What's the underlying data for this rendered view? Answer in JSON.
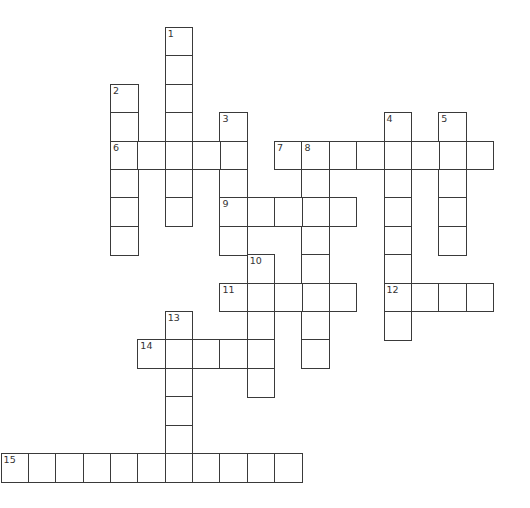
{
  "puzzle": {
    "grid": {
      "origin_x": 1.3,
      "origin_y": 27.7,
      "cell_w": 27.35,
      "cell_h": 28.4,
      "line_color": "#3a3a3a",
      "background": "#ffffff"
    },
    "entries": [
      {
        "number": "1",
        "direction": "down",
        "row": 0,
        "col": 6,
        "length": 7
      },
      {
        "number": "2",
        "direction": "down",
        "row": 2,
        "col": 4,
        "length": 6
      },
      {
        "number": "3",
        "direction": "down",
        "row": 3,
        "col": 8,
        "length": 5
      },
      {
        "number": "4",
        "direction": "down",
        "row": 3,
        "col": 14,
        "length": 8
      },
      {
        "number": "5",
        "direction": "down",
        "row": 3,
        "col": 16,
        "length": 5
      },
      {
        "number": "6",
        "direction": "across",
        "row": 4,
        "col": 4,
        "length": 5
      },
      {
        "number": "7",
        "direction": "across",
        "row": 4,
        "col": 10,
        "length": 8
      },
      {
        "number": "8",
        "direction": "down",
        "row": 4,
        "col": 11,
        "length": 8
      },
      {
        "number": "9",
        "direction": "across",
        "row": 6,
        "col": 8,
        "length": 5
      },
      {
        "number": "10",
        "direction": "down",
        "row": 8,
        "col": 9,
        "length": 5
      },
      {
        "number": "11",
        "direction": "across",
        "row": 9,
        "col": 8,
        "length": 5
      },
      {
        "number": "12",
        "direction": "across",
        "row": 9,
        "col": 14,
        "length": 4
      },
      {
        "number": "13",
        "direction": "down",
        "row": 10,
        "col": 6,
        "length": 6
      },
      {
        "number": "14",
        "direction": "across",
        "row": 11,
        "col": 5,
        "length": 5
      },
      {
        "number": "15",
        "direction": "across",
        "row": 15,
        "col": 0,
        "length": 11
      }
    ]
  }
}
